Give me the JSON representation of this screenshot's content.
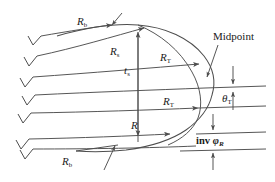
{
  "figure": {
    "background_color": "#ffffff",
    "line_color": "#4d4d4d",
    "text_color": "#1a1a1a",
    "width": 275,
    "height": 182
  },
  "labels": {
    "r_b_top": {
      "base": "R",
      "sub": "b"
    },
    "r_s": {
      "base": "R",
      "sub": "s"
    },
    "t_s": {
      "base": "t",
      "sub": "s"
    },
    "r_t_upper": {
      "base": "R",
      "sub": "T"
    },
    "r_t_lower": {
      "base": "R",
      "sub": "T"
    },
    "midpoint": {
      "base": "Midpoint",
      "sub": ""
    },
    "theta_t": {
      "base": "θ",
      "sub": "T"
    },
    "r_pitch": {
      "base": "R",
      "sub": ""
    },
    "inv_phi_r": {
      "base": "inv ",
      "sym": "φ",
      "sub": "R"
    },
    "r_b_bottom": {
      "base": "R",
      "sub": "b"
    }
  },
  "geometry": {
    "tick_marks_count": 6,
    "radial_lines_count": 6,
    "dimension_arrows": [
      "R_b top leader",
      "R_s span",
      "t_s vertical double arrow",
      "R_T upper span",
      "R_T lower span",
      "R span",
      "theta_T pair",
      "inv phi_R pair",
      "R_b bottom leader",
      "Midpoint leader"
    ]
  }
}
